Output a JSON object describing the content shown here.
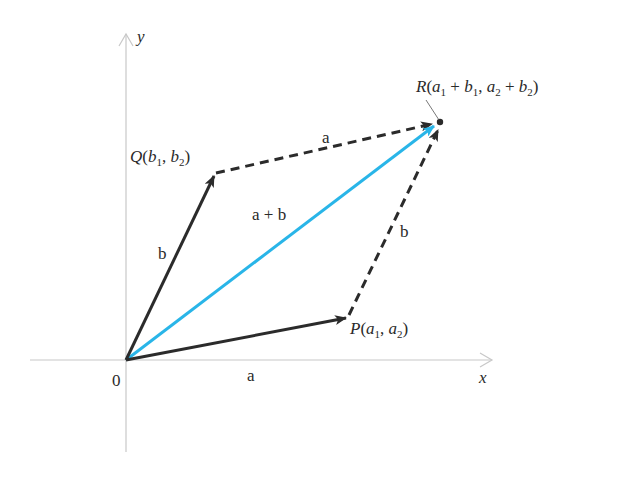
{
  "diagram": {
    "colors": {
      "axis": "#c8c8c8",
      "vector": "#2b2b2b",
      "sum": "#29b5e8",
      "text": "#2a2a2a"
    },
    "axes": {
      "x_label": "x",
      "y_label": "y",
      "origin_label": "0"
    },
    "points": {
      "origin": {
        "x": 126,
        "y": 360
      },
      "P": {
        "x": 348,
        "y": 317
      },
      "Q": {
        "x": 215,
        "y": 173
      },
      "R": {
        "x": 440,
        "y": 122
      }
    },
    "point_labels": {
      "P": {
        "name": "P",
        "open": "(",
        "c1": "a",
        "c1_sub": "1",
        "sep": ", ",
        "c2": "a",
        "c2_sub": "2",
        "close": ")"
      },
      "Q": {
        "name": "Q",
        "open": "(",
        "c1": "b",
        "c1_sub": "1",
        "sep": ", ",
        "c2": "b",
        "c2_sub": "2",
        "close": ")"
      },
      "R": {
        "name": "R",
        "open": "(",
        "c1": "a",
        "c1_sub": "1",
        "plus1": " + ",
        "c2": "b",
        "c2_sub": "1",
        "sep": ", ",
        "c3": "a",
        "c3_sub": "2",
        "plus2": " + ",
        "c4": "b",
        "c4_sub": "2",
        "close": ")"
      }
    },
    "vectors": [
      {
        "id": "a",
        "from": "origin",
        "to": "P",
        "label": "a",
        "style": "solid"
      },
      {
        "id": "b",
        "from": "origin",
        "to": "Q",
        "label": "b",
        "style": "solid"
      },
      {
        "id": "a_shift",
        "from": "Q",
        "to": "R",
        "label": "a",
        "style": "dashed"
      },
      {
        "id": "b_shift",
        "from": "P",
        "to": "R",
        "label": "b",
        "style": "dashed"
      },
      {
        "id": "a_plus_b",
        "from": "origin",
        "to": "R",
        "label": "a + b",
        "style": "solid-blue"
      }
    ]
  }
}
